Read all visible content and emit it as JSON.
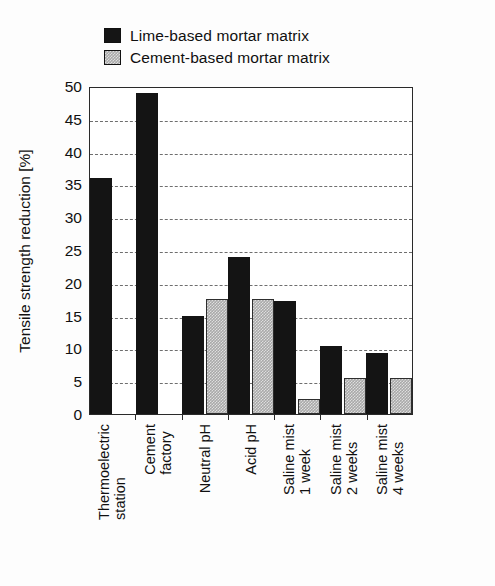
{
  "chart_data": {
    "type": "bar",
    "title": "",
    "xlabel": "",
    "ylabel": "Tensile strength reduction [%]",
    "ylim": [
      0,
      50
    ],
    "yticks": [
      0,
      5,
      10,
      15,
      20,
      25,
      30,
      35,
      40,
      45,
      50
    ],
    "ytick_labels": [
      "0",
      "5",
      "10",
      "15",
      "20",
      "25",
      "30",
      "35",
      "40",
      "45",
      "50"
    ],
    "grid": "horizontal-dashed",
    "legend_position": "above-plot-left",
    "categories": [
      "Thermoelectric station",
      "Cement factory",
      "Neutral pH",
      "Acid pH",
      "Saline mist 1 week",
      "Saline mist 2 weeks",
      "Saline mist 4 weeks"
    ],
    "category_lines": [
      [
        "Thermoelectric",
        "station"
      ],
      [
        "Cement",
        "factory"
      ],
      [
        "Neutral pH",
        ""
      ],
      [
        "Acid pH",
        ""
      ],
      [
        "Saline mist",
        "1 week"
      ],
      [
        "Saline mist",
        "2 weeks"
      ],
      [
        "Saline mist",
        "4 weeks"
      ]
    ],
    "series": [
      {
        "name": "Lime-based mortar matrix",
        "color": "#141414",
        "swatch": "dark",
        "values": [
          36,
          49,
          15,
          24,
          17.3,
          10.3,
          9.3
        ]
      },
      {
        "name": "Cement-based mortar matrix",
        "color": "#a9a9a9",
        "swatch": "light",
        "values": [
          null,
          null,
          17.5,
          17.5,
          2.3,
          5.5,
          5.5
        ]
      }
    ]
  },
  "legend": {
    "items": [
      {
        "label": "Lime-based mortar matrix",
        "swatch": "dark"
      },
      {
        "label": "Cement-based mortar matrix",
        "swatch": "light"
      }
    ]
  },
  "axis": {
    "y_title": "Tensile strength reduction [%]"
  }
}
